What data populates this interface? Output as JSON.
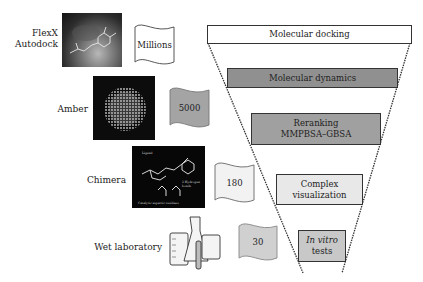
{
  "tools": [
    {
      "label_lines": [
        "FlexX",
        "Autodock"
      ],
      "image": "docking-complex-image",
      "count": "Millions",
      "flag_fill": "#ffffff"
    },
    {
      "label_lines": [
        "Amber"
      ],
      "image": "protein-dynamics-image",
      "count": "5000",
      "flag_fill": "#a4a4a4"
    },
    {
      "label_lines": [
        "Chimera"
      ],
      "image": "ligand-binding-visualization-image",
      "count": "180",
      "flag_fill": "#f2f2f2",
      "image_annotations": {
        "ligand": "Ligand",
        "hbonds": "2 Hydrogen bonds",
        "residues": "Catalytic aspartic residues"
      }
    },
    {
      "label_lines": [
        "Wet laboratory"
      ],
      "image": "lab-glassware-image",
      "count": "30",
      "flag_fill": "#d0d0d0"
    }
  ],
  "funnel": {
    "stages": [
      {
        "lines": [
          "Molecular docking"
        ],
        "fill": "#ffffff",
        "italic_first": false
      },
      {
        "lines": [
          "Molecular dynamics"
        ],
        "fill": "#909090",
        "italic_first": false
      },
      {
        "lines": [
          "Reranking",
          "MMPBSA–GBSA"
        ],
        "fill": "#a0a0a0",
        "italic_first": false
      },
      {
        "lines": [
          "Complex",
          "visualization"
        ],
        "fill": "#e8e8e8",
        "italic_first": false
      },
      {
        "lines": [
          "In vitro",
          "tests"
        ],
        "fill": "#c8c8c8",
        "italic_first": true
      }
    ]
  }
}
